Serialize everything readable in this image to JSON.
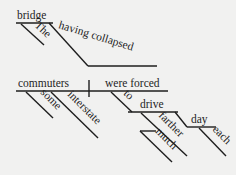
{
  "diagram": {
    "type": "Reed-Kellogg sentence diagram",
    "words": {
      "bridge": "bridge",
      "the": "The",
      "having_collapsed": "having collapsed",
      "commuters": "commuters",
      "were_forced": "were forced",
      "some": "some",
      "interstate": "interstate",
      "to": "to",
      "drive": "drive",
      "farther": "farther",
      "much": "much",
      "day": "day",
      "each": "each"
    },
    "colors": {
      "background": "#f1f1f0",
      "ink": "#1e1e1e"
    }
  }
}
